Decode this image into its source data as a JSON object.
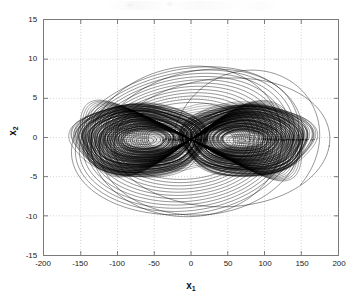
{
  "figure": {
    "type": "matlab-figure",
    "background_color": "#ffffff",
    "axes_border_color": "#7a7a7a",
    "grid_color": "#bfbfbf",
    "trace_color": "#000000",
    "has_scan_artifact": true
  },
  "axes": {
    "x_label": "x",
    "x_label_sub": "1",
    "y_label": "x",
    "y_label_sub": "2",
    "x_ticks": [
      "-200",
      "-150",
      "-100",
      "-50",
      "0",
      "50",
      "100",
      "150",
      "200"
    ],
    "y_ticks": [
      "15",
      "10",
      "5",
      "0",
      "-5",
      "-10",
      "-15"
    ]
  },
  "chart_data": {
    "type": "line",
    "title": "",
    "xlabel": "x_1",
    "ylabel": "x_2",
    "xlim": [
      -200,
      200
    ],
    "ylim": [
      -15,
      15
    ],
    "xticks": [
      -200,
      -150,
      -100,
      -50,
      0,
      50,
      100,
      150,
      200
    ],
    "yticks": [
      -15,
      -10,
      -5,
      0,
      5,
      10,
      15
    ],
    "grid": true,
    "legend": "none",
    "series": [
      {
        "name": "trajectory",
        "color": "#000000",
        "left_lobe_center": [
          -62,
          -0.3
        ],
        "right_lobe_center": [
          68,
          -0.3
        ],
        "saddle_point": [
          0,
          0
        ],
        "lobe_extent_x": [
          -150,
          150
        ],
        "lobe_extent_y": [
          -4.6,
          4.6
        ],
        "outer_loops_count": 12,
        "outer_extent_x": [
          -152,
          190
        ],
        "outer_extent_y": [
          -10.2,
          9.2
        ],
        "inner_rings_per_lobe": 26
      }
    ]
  }
}
